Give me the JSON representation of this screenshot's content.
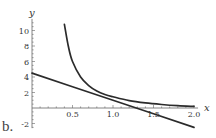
{
  "panel_label": "b.",
  "chart_data": {
    "type": "line",
    "title": "",
    "xlabel": "x",
    "ylabel": "y",
    "xlim": [
      0,
      2.05
    ],
    "ylim": [
      -2.6,
      11.5
    ],
    "x_ticks": [
      0.5,
      1.0,
      1.5,
      2.0
    ],
    "x_tick_labels": [
      "0.5",
      "1.0",
      "1.5",
      "2.0"
    ],
    "y_ticks": [
      -2,
      2,
      4,
      6,
      8,
      10
    ],
    "y_tick_labels": [
      "-2",
      "2",
      "4",
      "6",
      "8",
      "10"
    ],
    "grid": false,
    "legend": null,
    "series": [
      {
        "name": "curve",
        "description": "decreasing curve, steep near x=0.4, flattening toward x-axis",
        "x": [
          0.4,
          0.45,
          0.5,
          0.6,
          0.7,
          0.8,
          0.9,
          1.0,
          1.2,
          1.4,
          1.6,
          1.8,
          2.0
        ],
        "y": [
          10.8,
          7.9,
          6.0,
          4.0,
          2.9,
          2.2,
          1.75,
          1.45,
          0.95,
          0.65,
          0.45,
          0.3,
          0.2
        ]
      },
      {
        "name": "line",
        "description": "straight line with negative slope",
        "x": [
          0.0,
          0.5,
          1.0,
          1.5,
          2.0
        ],
        "y": [
          4.5,
          2.75,
          1.0,
          -0.75,
          -2.5
        ]
      }
    ],
    "colors": {
      "curves": "#2b2b2b",
      "axes": "#666666"
    }
  }
}
